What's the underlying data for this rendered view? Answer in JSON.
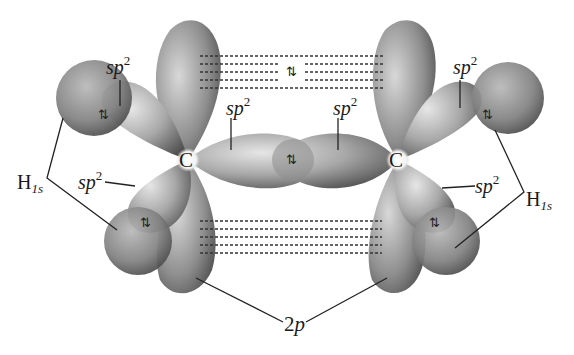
{
  "diagram": {
    "type": "orbital-overlap",
    "labels": {
      "sp2": "sp",
      "sp2_sup": "2",
      "carbon": "C",
      "hydrogen_main": "H",
      "hydrogen_sub": "1s",
      "p_orbital_num": "2",
      "p_orbital_letter": "p",
      "electron_pair": "⇅"
    },
    "annotations": [
      {
        "id": "sp2-top-left",
        "text": "sp2"
      },
      {
        "id": "sp2-top-right",
        "text": "sp2"
      },
      {
        "id": "sp2-center-left",
        "text": "sp2"
      },
      {
        "id": "sp2-center-right",
        "text": "sp2"
      },
      {
        "id": "sp2-lower-left",
        "text": "sp2"
      },
      {
        "id": "sp2-lower-right",
        "text": "sp2"
      },
      {
        "id": "h1s-left",
        "text": "H1s"
      },
      {
        "id": "h1s-right",
        "text": "H1s"
      },
      {
        "id": "2p",
        "text": "2p"
      }
    ],
    "colors": {
      "orbital_light": "#d9d9d9",
      "orbital_mid": "#9a9a9a",
      "orbital_dark": "#4a4a4a",
      "line": "#222222",
      "background": "#ffffff"
    }
  }
}
